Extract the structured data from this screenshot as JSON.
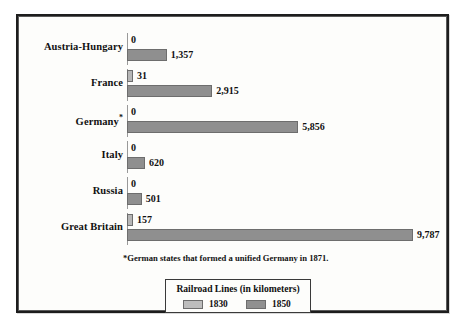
{
  "chart_data": {
    "type": "bar",
    "orientation": "horizontal",
    "title": "",
    "xlabel": "",
    "ylabel": "",
    "categories": [
      "Austria-Hungary",
      "France",
      "Germany*",
      "Italy",
      "Russia",
      "Great Britain"
    ],
    "series": [
      {
        "name": "1830",
        "color": "#b6b6b6",
        "values": [
          0,
          31,
          0,
          0,
          0,
          157
        ]
      },
      {
        "name": "1850",
        "color": "#8f8f8f",
        "values": [
          1357,
          2915,
          5856,
          620,
          501,
          9787
        ]
      }
    ],
    "value_labels": [
      {
        "category": "Austria-Hungary",
        "s1830": "0",
        "s1850": "1,357"
      },
      {
        "category": "France",
        "s1830": "31",
        "s1850": "2,915"
      },
      {
        "category": "Germany*",
        "s1830": "0",
        "s1850": "5,856"
      },
      {
        "category": "Italy",
        "s1830": "0",
        "s1850": "620"
      },
      {
        "category": "Russia",
        "s1830": "0",
        "s1850": "501"
      },
      {
        "category": "Great Britain",
        "s1830": "157",
        "s1850": "9,787"
      }
    ],
    "xlim": [
      0,
      9787
    ],
    "grid": false,
    "legend_position": "bottom-center",
    "units": "kilometers",
    "footnote": "*German states that formed a unified Germany in 1871.",
    "legend": {
      "title": "Railroad Lines (in kilometers)",
      "entries": [
        {
          "label": "1830",
          "color": "#bdbdbd"
        },
        {
          "label": "1850",
          "color": "#909090"
        }
      ]
    }
  },
  "rows": [
    {
      "label": "Austria-Hungary",
      "label_plain": "Austria-Hungary",
      "star": "",
      "v1830": "0",
      "v1850": "1,357"
    },
    {
      "label": "France",
      "label_plain": "France",
      "star": "",
      "v1830": "31",
      "v1850": "2,915"
    },
    {
      "label": "Germany",
      "label_plain": "Germany*",
      "star": "*",
      "v1830": "0",
      "v1850": "5,856"
    },
    {
      "label": "Italy",
      "label_plain": "Italy",
      "star": "",
      "v1830": "0",
      "v1850": "620"
    },
    {
      "label": "Russia",
      "label_plain": "Russia",
      "star": "",
      "v1830": "0",
      "v1850": "501"
    },
    {
      "label": "Great Britain",
      "label_plain": "Great Britain",
      "star": "",
      "v1830": "157",
      "v1850": "9,787"
    }
  ],
  "footnote": "*German states that formed a unified Germany in 1871.",
  "legend": {
    "title": "Railroad Lines (in kilometers)",
    "item0": "1830",
    "item1": "1850"
  }
}
